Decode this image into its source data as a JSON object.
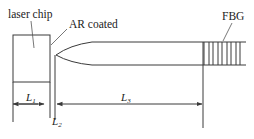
{
  "labels": {
    "laser_chip": "laser chip",
    "ar_coated": "AR coated",
    "fbg": "FBG"
  },
  "dimensions": {
    "l1": {
      "symbol": "L",
      "subscript": "1"
    },
    "l2": {
      "symbol": "L",
      "subscript": "2"
    },
    "l3": {
      "symbol": "L",
      "subscript": "3"
    }
  },
  "grating": {
    "line_count": 9
  },
  "colors": {
    "stroke": "#3a3a3a",
    "text": "#222222",
    "background": "#ffffff"
  }
}
